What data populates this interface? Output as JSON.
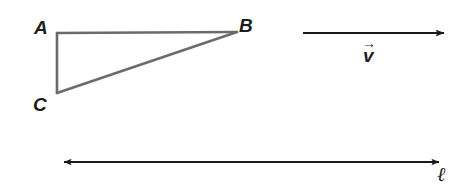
{
  "figure": {
    "background_color": "#ffffff",
    "width": 458,
    "height": 185,
    "triangle": {
      "name": "triangle-ABC",
      "stroke_color": "#6b6b6b",
      "stroke_width": 2.5,
      "vertices": [
        {
          "label": "A",
          "x": 57,
          "y": 33
        },
        {
          "label": "B",
          "x": 237,
          "y": 32
        },
        {
          "label": "C",
          "x": 57,
          "y": 93
        }
      ],
      "labels": {
        "a": "A",
        "b": "B",
        "c": "C"
      }
    },
    "vector": {
      "name": "velocity-vector",
      "label": "v",
      "accent": "→",
      "stroke_color": "#1a1a1a",
      "stroke_width": 1.8,
      "x1": 303,
      "y1": 33,
      "x2": 450,
      "y2": 33,
      "arrowheads": "end"
    },
    "line": {
      "name": "line-ell",
      "label": "ℓ",
      "stroke_color": "#1a1a1a",
      "stroke_width": 2.2,
      "x1": 58,
      "y1": 162,
      "x2": 445,
      "y2": 162,
      "arrowheads": "both"
    }
  }
}
